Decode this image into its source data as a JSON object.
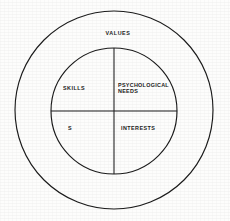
{
  "diagram": {
    "type": "concentric-circle-quadrant-diagram",
    "background_color": "#fdfdfc",
    "stroke_color": "#1b1b1b",
    "text_color": "#1b1b1b",
    "outer_ring": {
      "label": "VALUES",
      "center_x": 114,
      "center_y": 110,
      "radius": 99
    },
    "inner_circle": {
      "center_x": 114,
      "center_y": 111,
      "radius": 63
    },
    "dividers": {
      "vertical_x": 114,
      "horizontal_y": 111
    },
    "quadrants": [
      {
        "position": "upper-left",
        "label": "SKILLS"
      },
      {
        "position": "upper-right",
        "label": "PSYCHOLOGICAL\nNEEDS"
      },
      {
        "position": "lower-left",
        "label": "S"
      },
      {
        "position": "lower-right",
        "label": "INTERESTS"
      }
    ]
  }
}
